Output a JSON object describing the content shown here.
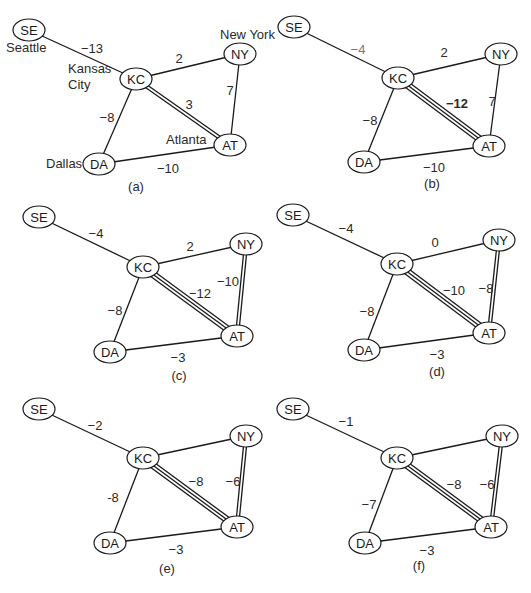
{
  "figure": {
    "nodes": [
      "SE",
      "KC",
      "NY",
      "AT",
      "DA"
    ],
    "city_names": {
      "SE": "Seattle",
      "KC": "Kansas City",
      "NY": "New York",
      "AT": "Atlanta",
      "DA": "Dallas"
    },
    "panels": [
      {
        "caption": "(a)",
        "offset": [
          0,
          0
        ],
        "show_city_names": true,
        "positions": {
          "SE": [
            29,
            30
          ],
          "KC": [
            136,
            79
          ],
          "NY": [
            240,
            54
          ],
          "AT": [
            230,
            145
          ],
          "DA": [
            99,
            164
          ]
        },
        "edges": [
          {
            "from": "SE",
            "to": "KC",
            "weight": "−13",
            "lines": 1,
            "label_pos": [
              92,
              48
            ]
          },
          {
            "from": "KC",
            "to": "NY",
            "weight": "2",
            "lines": 1,
            "label_pos": [
              179,
              58
            ]
          },
          {
            "from": "KC",
            "to": "AT",
            "weight": "3",
            "lines": 2,
            "label_pos": [
              189,
              104
            ]
          },
          {
            "from": "NY",
            "to": "AT",
            "weight": "7",
            "lines": 1,
            "label_pos": [
              230,
              90
            ]
          },
          {
            "from": "KC",
            "to": "DA",
            "weight": "−8",
            "lines": 1,
            "label_pos": [
              107,
              117
            ]
          },
          {
            "from": "DA",
            "to": "AT",
            "weight": "−10",
            "lines": 1,
            "label_pos": [
              168,
              168
            ]
          }
        ]
      },
      {
        "caption": "(b)",
        "offset": [
          0,
          0
        ],
        "show_city_names": false,
        "positions": {
          "SE": [
            294,
            27
          ],
          "KC": [
            398,
            78
          ],
          "NY": [
            501,
            54
          ],
          "AT": [
            489,
            146
          ],
          "DA": [
            364,
            162
          ]
        },
        "edges": [
          {
            "from": "SE",
            "to": "KC",
            "weight": "−4",
            "lines": 1,
            "label_pos": [
              358,
              49
            ],
            "style": "faint"
          },
          {
            "from": "KC",
            "to": "NY",
            "weight": "2",
            "lines": 1,
            "label_pos": [
              444,
              52
            ]
          },
          {
            "from": "KC",
            "to": "AT",
            "weight": "−12",
            "lines": 3,
            "label_pos": [
              457,
              103
            ],
            "style": "bold"
          },
          {
            "from": "NY",
            "to": "AT",
            "weight": "7",
            "lines": 1,
            "label_pos": [
              492,
              101
            ]
          },
          {
            "from": "KC",
            "to": "DA",
            "weight": "−8",
            "lines": 1,
            "label_pos": [
              370,
              120
            ]
          },
          {
            "from": "DA",
            "to": "AT",
            "weight": "−10",
            "lines": 1,
            "label_pos": [
              434,
              167
            ]
          }
        ]
      },
      {
        "caption": "(c)",
        "offset": [
          0,
          0
        ],
        "show_city_names": false,
        "positions": {
          "SE": [
            39,
            217
          ],
          "KC": [
            143,
            267
          ],
          "NY": [
            246,
            244
          ],
          "AT": [
            237,
            336
          ],
          "DA": [
            110,
            352
          ]
        },
        "edges": [
          {
            "from": "SE",
            "to": "KC",
            "weight": "−4",
            "lines": 1,
            "label_pos": [
              96,
              233
            ]
          },
          {
            "from": "KC",
            "to": "NY",
            "weight": "2",
            "lines": 1,
            "label_pos": [
              190,
              246
            ]
          },
          {
            "from": "KC",
            "to": "AT",
            "weight": "−12",
            "lines": 3,
            "label_pos": [
              200,
              293
            ]
          },
          {
            "from": "NY",
            "to": "AT",
            "weight": "−10",
            "lines": 2,
            "label_pos": [
              228,
              281
            ]
          },
          {
            "from": "KC",
            "to": "DA",
            "weight": "−8",
            "lines": 1,
            "label_pos": [
              115,
              310
            ]
          },
          {
            "from": "DA",
            "to": "AT",
            "weight": "−3",
            "lines": 1,
            "label_pos": [
              178,
              357
            ]
          }
        ]
      },
      {
        "caption": "(d)",
        "offset": [
          0,
          0
        ],
        "show_city_names": false,
        "positions": {
          "SE": [
            293,
            215
          ],
          "KC": [
            397,
            264
          ],
          "NY": [
            499,
            240
          ],
          "AT": [
            489,
            333
          ],
          "DA": [
            364,
            350
          ]
        },
        "edges": [
          {
            "from": "SE",
            "to": "KC",
            "weight": "−4",
            "lines": 1,
            "label_pos": [
              346,
              228
            ]
          },
          {
            "from": "KC",
            "to": "NY",
            "weight": "0",
            "lines": 1,
            "label_pos": [
              435,
              242
            ]
          },
          {
            "from": "KC",
            "to": "AT",
            "weight": "−10",
            "lines": 3,
            "label_pos": [
              454,
              290
            ]
          },
          {
            "from": "NY",
            "to": "AT",
            "weight": "−8",
            "lines": 2,
            "label_pos": [
              486,
              288
            ]
          },
          {
            "from": "KC",
            "to": "DA",
            "weight": "−8",
            "lines": 1,
            "label_pos": [
              367,
              311
            ]
          },
          {
            "from": "DA",
            "to": "AT",
            "weight": "−3",
            "lines": 1,
            "label_pos": [
              437,
              354
            ]
          }
        ]
      },
      {
        "caption": "(e)",
        "offset": [
          0,
          0
        ],
        "show_city_names": false,
        "positions": {
          "SE": [
            39,
            409
          ],
          "KC": [
            143,
            458
          ],
          "NY": [
            246,
            436
          ],
          "AT": [
            237,
            527
          ],
          "DA": [
            110,
            543
          ]
        },
        "edges": [
          {
            "from": "SE",
            "to": "KC",
            "weight": "−2",
            "lines": 1,
            "label_pos": [
              95,
              425
            ]
          },
          {
            "from": "KC",
            "to": "NY",
            "weight": "",
            "lines": 1,
            "label_pos": [
              190,
              440
            ]
          },
          {
            "from": "KC",
            "to": "AT",
            "weight": "−8",
            "lines": 3,
            "label_pos": [
              196,
              481
            ]
          },
          {
            "from": "NY",
            "to": "AT",
            "weight": "−6",
            "lines": 2,
            "label_pos": [
              233,
              481
            ]
          },
          {
            "from": "KC",
            "to": "DA",
            "weight": "-8",
            "lines": 1,
            "label_pos": [
              113,
              497
            ]
          },
          {
            "from": "DA",
            "to": "AT",
            "weight": "−3",
            "lines": 1,
            "label_pos": [
              176,
              549
            ]
          }
        ]
      },
      {
        "caption": "(f)",
        "offset": [
          0,
          0
        ],
        "show_city_names": false,
        "positions": {
          "SE": [
            293,
            409
          ],
          "KC": [
            397,
            458
          ],
          "NY": [
            502,
            436
          ],
          "AT": [
            491,
            527
          ],
          "DA": [
            365,
            543
          ]
        },
        "edges": [
          {
            "from": "SE",
            "to": "KC",
            "weight": "−1",
            "lines": 1,
            "label_pos": [
              346,
              421
            ]
          },
          {
            "from": "KC",
            "to": "NY",
            "weight": "",
            "lines": 1,
            "label_pos": [
              445,
              440
            ]
          },
          {
            "from": "KC",
            "to": "AT",
            "weight": "−8",
            "lines": 3,
            "label_pos": [
              454,
              484
            ]
          },
          {
            "from": "NY",
            "to": "AT",
            "weight": "−6",
            "lines": 2,
            "label_pos": [
              487,
              484
            ]
          },
          {
            "from": "KC",
            "to": "DA",
            "weight": "−7",
            "lines": 1,
            "label_pos": [
              369,
              504
            ]
          },
          {
            "from": "DA",
            "to": "AT",
            "weight": "−3",
            "lines": 1,
            "label_pos": [
              427,
              550
            ]
          }
        ]
      }
    ],
    "caption_positions": [
      [
        136,
        191
      ],
      [
        432,
        188
      ],
      [
        179,
        380
      ],
      [
        437,
        376
      ],
      [
        167,
        573
      ],
      [
        419,
        570
      ]
    ],
    "city_label_positions": {
      "SE": [
        6,
        52
      ],
      "KC": [
        68,
        73
      ],
      "KC2": [
        68,
        89
      ],
      "NY": [
        220,
        39
      ],
      "AT": [
        166,
        144
      ],
      "DA": [
        46,
        168
      ]
    },
    "city_label_text": {
      "KC_line1": "Kansas",
      "KC_line2": "City"
    }
  }
}
